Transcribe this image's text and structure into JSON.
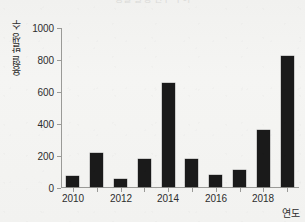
{
  "chart_data": {
    "type": "bar",
    "title": "용혈 발생 건수 추이",
    "title_note": "cropped at top edge of scan",
    "xlabel": "연도",
    "ylabel": "용혈 발생 수",
    "categories": [
      "2010",
      "2011",
      "2012",
      "2013",
      "2014",
      "2015",
      "2016",
      "2017",
      "2018",
      "2019"
    ],
    "values": [
      69,
      212,
      50,
      177,
      652,
      174,
      73,
      106,
      356,
      818
    ],
    "ylim": [
      0,
      1000
    ],
    "yticks": [
      0,
      200,
      400,
      600,
      800,
      1000
    ],
    "ytick_labels": [
      "0",
      "200",
      "400",
      "600",
      "800",
      "1000"
    ],
    "xtick_labels": [
      "2010",
      "2012",
      "2014",
      "2016",
      "2018"
    ],
    "xticks_shown_every": 2,
    "grid": false,
    "legend": null,
    "bar_color": "#1a1a1a",
    "axis_color": "#9a9a97",
    "background_color": "#f3f3f1",
    "text_color": "#2d2d2d"
  },
  "axes": {
    "y_title": "용혈 발생 수",
    "x_title": "연도"
  }
}
